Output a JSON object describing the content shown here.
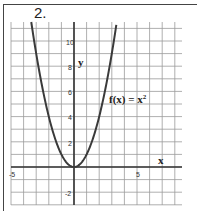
{
  "problem": {
    "number": "2."
  },
  "graph": {
    "function_label": "f(x) = x²",
    "function_label_parts": {
      "lhs": "f(x) = x",
      "exp": "2"
    },
    "x_axis_label": "x",
    "y_axis_label": "y",
    "x_tick_labels": [
      "-5",
      "5"
    ],
    "y_tick_labels": [
      "10",
      "8",
      "6",
      "4",
      "2",
      "-2"
    ],
    "colors": {
      "grid": "#9a9a9a",
      "axis": "#333333",
      "curve": "#3a3a3a",
      "frame": "#444444"
    }
  },
  "chart_data": {
    "type": "line",
    "xlabel": "x",
    "ylabel": "y",
    "xlim": [
      -5,
      8.5
    ],
    "ylim": [
      -3,
      11.5
    ],
    "grid": true,
    "x_ticks_labeled": [
      -5,
      5
    ],
    "y_ticks_labeled": [
      -2,
      2,
      4,
      6,
      8,
      10
    ],
    "series": [
      {
        "name": "f(x) = x^2",
        "x": [
          -3.4,
          -3,
          -2.5,
          -2,
          -1.5,
          -1,
          -0.5,
          0,
          0.5,
          1,
          1.5,
          2,
          2.5,
          3,
          3.4
        ],
        "y": [
          11.56,
          9,
          6.25,
          4,
          2.25,
          1,
          0.25,
          0,
          0.25,
          1,
          2.25,
          4,
          6.25,
          9,
          11.56
        ]
      }
    ],
    "annotations": [
      "f(x) = x²"
    ]
  }
}
